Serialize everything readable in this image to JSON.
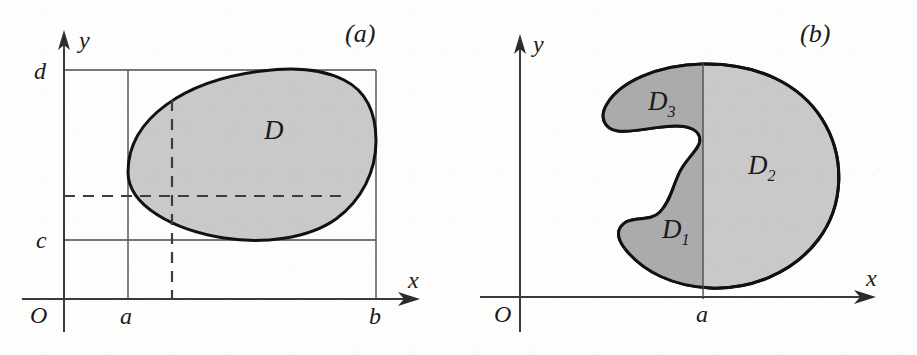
{
  "figure": {
    "kind": "math-diagram",
    "width": 917,
    "height": 355,
    "background_color": "#fdfdfc"
  },
  "colors": {
    "ink": "#111111",
    "axis": "#3a3a3a",
    "guide": "#4a4a4a",
    "region_fill_light": "#c9c9c9",
    "region_fill_dark": "#ababab",
    "paper": "#fdfdfc"
  },
  "panels": [
    {
      "id": "panel-a",
      "caption": "(a)",
      "axes": {
        "x_label": "x",
        "y_label": "y",
        "origin_label": "O"
      },
      "tick_labels": {
        "x_left": "a",
        "x_right": "b",
        "y_bottom": "c",
        "y_top": "d"
      },
      "region_label": "D",
      "guides": [
        "horizontal line at y = d",
        "horizontal line at y = c",
        "vertical line at x = a",
        "vertical line at x = b"
      ],
      "dashed_guides": [
        "vertical dashed chord inside D",
        "horizontal dashed chord inside D"
      ]
    },
    {
      "id": "panel-b",
      "caption": "(b)",
      "axes": {
        "x_label": "x",
        "y_label": "y",
        "origin_label": "O"
      },
      "tick_labels": {
        "x_cut": "a"
      },
      "region_labels": {
        "lower_left": "D",
        "lower_left_sub": "1",
        "right": "D",
        "right_sub": "2",
        "upper_left": "D",
        "upper_left_sub": "3"
      },
      "guides": [
        "vertical line at x = a splitting the region"
      ]
    }
  ]
}
